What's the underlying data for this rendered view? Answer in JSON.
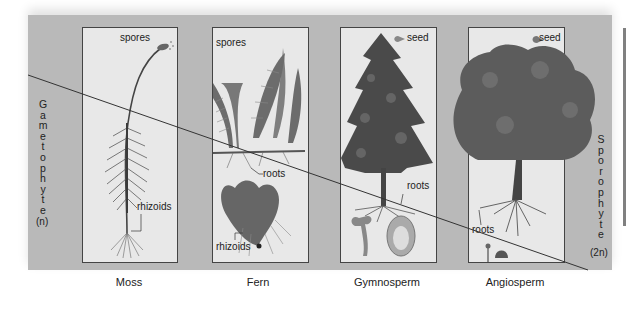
{
  "figure": {
    "left_label": {
      "letters": [
        "G",
        "a",
        "m",
        "e",
        "t",
        "o",
        "p",
        "h",
        "y",
        "t",
        "e"
      ],
      "text": "Gametophyte",
      "ploidy": "(n)"
    },
    "right_label": {
      "letters": [
        "S",
        "p",
        "o",
        "r",
        "o",
        "p",
        "h",
        "y",
        "t",
        "e"
      ],
      "text": "Sporophyte",
      "ploidy": "(2n)"
    },
    "plants": [
      {
        "name": "Moss",
        "callouts": [
          "spores",
          "rhizoids"
        ]
      },
      {
        "name": "Fern",
        "callouts": [
          "spores",
          "roots",
          "rhizoids"
        ]
      },
      {
        "name": "Gymnosperm",
        "callouts": [
          "seed",
          "roots"
        ]
      },
      {
        "name": "Angiosperm",
        "callouts": [
          "seed",
          "roots"
        ]
      }
    ],
    "colors": {
      "panel": "#b9b9b9",
      "card": "#e8e8e8",
      "line": "#333333"
    }
  }
}
